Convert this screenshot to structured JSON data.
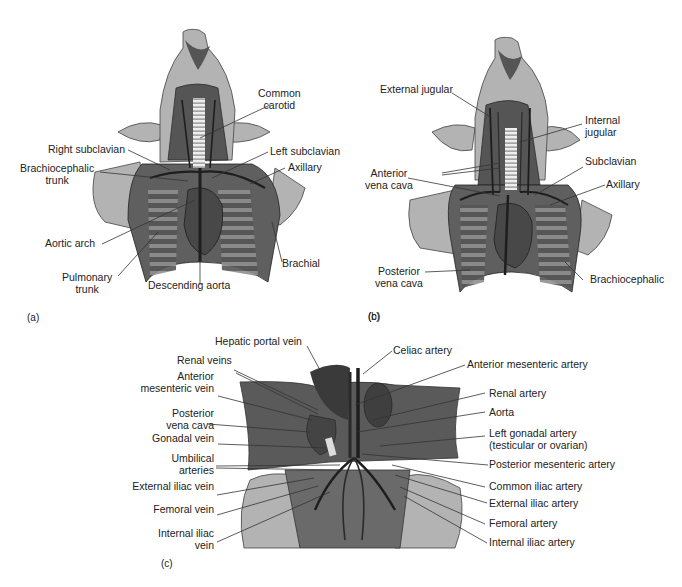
{
  "figure": {
    "panels": [
      {
        "id": "a",
        "letter": "(a)",
        "subject": "arteries of the thorax and neck",
        "labels": {
          "common_carotid": [
            "Common",
            "carotid"
          ],
          "right_subclavian": "Right subclavian",
          "left_subclavian": "Left subclavian",
          "brachiocephalic_trunk": [
            "Brachiocephalic",
            "trunk"
          ],
          "axillary": "Axillary",
          "aortic_arch": "Aortic arch",
          "brachial": "Brachial",
          "pulmonary_trunk": [
            "Pulmonary",
            "trunk"
          ],
          "descending_aorta": "Descending aorta"
        }
      },
      {
        "id": "b",
        "letter": "(b)",
        "subject": "veins of the thorax and neck",
        "labels": {
          "external_jugular": "External jugular",
          "internal_jugular": [
            "Internal",
            "jugular"
          ],
          "anterior_vena_cava": [
            "Anterior",
            "vena cava"
          ],
          "subclavian": "Subclavian",
          "axillary": "Axillary",
          "posterior_vena_cava": [
            "Posterior",
            "vena cava"
          ],
          "brachiocephalic": "Brachiocephalic"
        }
      },
      {
        "id": "c",
        "letter": "(c)",
        "subject": "vessels of the abdomen",
        "labels_left": {
          "hepatic_portal_vein": "Hepatic portal vein",
          "renal_veins": "Renal veins",
          "anterior_mesenteric_vein": [
            "Anterior",
            "mesenteric vein"
          ],
          "posterior_vena_cava": [
            "Posterior",
            "vena cava"
          ],
          "gonadal_vein": "Gonadal vein",
          "umbilical_arteries": [
            "Umbilical",
            "arteries"
          ],
          "external_iliac_vein": "External iliac vein",
          "femoral_vein": "Femoral vein",
          "internal_iliac_vein": [
            "Internal iliac",
            "vein"
          ]
        },
        "labels_right": {
          "celiac_artery": "Celiac artery",
          "anterior_mesenteric_artery": "Anterior mesenteric artery",
          "renal_artery": "Renal artery",
          "aorta": "Aorta",
          "left_gonadal_artery": [
            "Left gonadal artery",
            "(testicular or ovarian)"
          ],
          "posterior_mesenteric_artery": "Posterior mesenteric artery",
          "common_iliac_artery": "Common iliac artery",
          "external_iliac_artery": "External iliac artery",
          "femoral_artery": "Femoral artery",
          "internal_iliac_artery": "Internal iliac artery"
        }
      }
    ],
    "colors": {
      "skin": "#b3b3b3",
      "muscle": "#5f5f5f",
      "muscle_dark": "#474747",
      "vessel": "#1e1e1e",
      "rib": "#8a8a8a",
      "trachea": "#e6e6e6",
      "leader_line": "#333333"
    }
  }
}
